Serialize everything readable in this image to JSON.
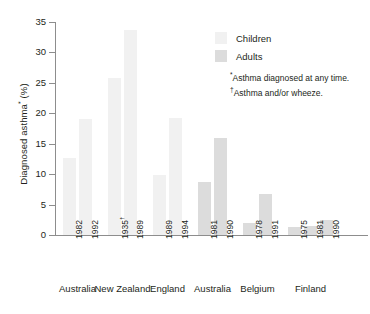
{
  "chart_data": {
    "type": "bar",
    "title": "",
    "xlabel": "",
    "ylabel": "Diagnosed asthma* (%)",
    "ylabel_text": "Diagnosed asthma",
    "ylabel_mark": "*",
    "ylabel_unit": " (%)",
    "ylim": [
      0,
      35
    ],
    "yticks": [
      0,
      5,
      10,
      15,
      20,
      25,
      30,
      35
    ],
    "ytick_labels": [
      "0",
      "5",
      "10",
      "15",
      "20",
      "25",
      "30",
      "35"
    ],
    "grid": false,
    "legend_position": "top-right",
    "legend": [
      {
        "name": "Children",
        "color": "#f1f1f1"
      },
      {
        "name": "Adults",
        "color": "#dcdcdc"
      }
    ],
    "annotations": [
      "*Asthma diagnosed at any time.",
      "†Asthma and/or wheeze."
    ],
    "groups": [
      {
        "name": "Australia",
        "series": "Children",
        "bars": [
          {
            "year": "1982",
            "mark": "",
            "value": 12.7
          },
          {
            "year": "1992",
            "mark": "",
            "value": 19.1
          }
        ]
      },
      {
        "name": "New Zealand",
        "series": "Children",
        "bars": [
          {
            "year": "1935",
            "mark": "†",
            "value": 25.8
          },
          {
            "year": "1989",
            "mark": "",
            "value": 33.7
          }
        ]
      },
      {
        "name": "England",
        "series": "Children",
        "bars": [
          {
            "year": "1989",
            "mark": "",
            "value": 9.9
          },
          {
            "year": "1994",
            "mark": "",
            "value": 19.3
          }
        ]
      },
      {
        "name": "Australia",
        "series": "Adults",
        "bars": [
          {
            "year": "1981",
            "mark": "",
            "value": 8.7
          },
          {
            "year": "1990",
            "mark": "",
            "value": 16.0
          }
        ]
      },
      {
        "name": "Belgium",
        "series": "Adults",
        "bars": [
          {
            "year": "1978",
            "mark": "",
            "value": 2.0
          },
          {
            "year": "1991",
            "mark": "",
            "value": 6.7
          }
        ]
      },
      {
        "name": "Finland",
        "series": "Adults",
        "bars": [
          {
            "year": "1975",
            "mark": "",
            "value": 1.3
          },
          {
            "year": "1981",
            "mark": "",
            "value": 1.5
          },
          {
            "year": "1990",
            "mark": "",
            "value": 2.5
          }
        ]
      }
    ]
  },
  "legend": {
    "children_label": "Children",
    "adults_label": "Adults"
  },
  "footnotes": {
    "line1_mark": "*",
    "line1_text": "Asthma diagnosed at any time.",
    "line2_mark": "†",
    "line2_text": "Asthma and/or wheeze."
  },
  "colors": {
    "children": "#f1f1f1",
    "adults": "#dcdcdc",
    "axis": "#8d8d8d",
    "text": "#231f20"
  }
}
